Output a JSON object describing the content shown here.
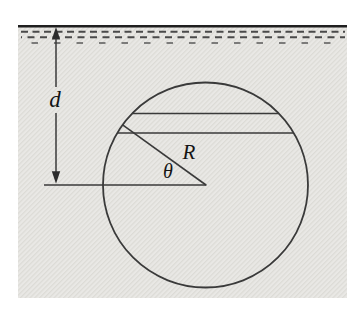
{
  "figure": {
    "labels": {
      "depth": "d",
      "radius": "R",
      "angle": "θ"
    },
    "colors": {
      "page_background": "#ffffff",
      "fluid_fill": "#e9e8e5",
      "fluid_texture": "#dcdbd6",
      "ink": "#3a3a3a",
      "surface_line": "#1f1f1f",
      "ripple": "#4a4a4a",
      "circle_fill": "#ffffff",
      "label_ink": "#141414"
    }
  }
}
